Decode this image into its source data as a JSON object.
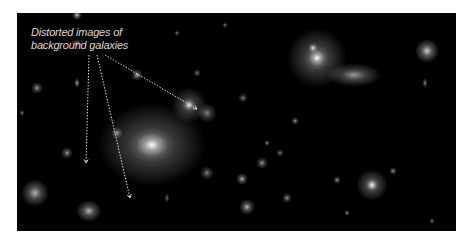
{
  "image": {
    "subject": "galaxy cluster with gravitationally lensed background galaxies",
    "background_color": "#000000",
    "frame": {
      "left": 17,
      "top": 13,
      "width": 439,
      "height": 218
    }
  },
  "annotation": {
    "caption_line1": "Distorted images of",
    "caption_line2": "background galaxies",
    "caption_color": "#d8d8d8",
    "arrow_color": "#dddddd",
    "arrows": [
      {
        "from": [
          72,
          42
        ],
        "to": [
          69,
          150
        ]
      },
      {
        "from": [
          80,
          42
        ],
        "to": [
          113,
          185
        ]
      },
      {
        "from": [
          88,
          42
        ],
        "to": [
          180,
          96
        ]
      }
    ]
  },
  "galaxies": [
    {
      "x": 135,
      "y": 132,
      "r": 42,
      "a": 0.55,
      "ex": 1.3
    },
    {
      "x": 135,
      "y": 132,
      "r": 12,
      "a": 0.95,
      "ex": 1.3
    },
    {
      "x": 300,
      "y": 45,
      "r": 30,
      "a": 0.55,
      "ex": 1
    },
    {
      "x": 300,
      "y": 45,
      "r": 8,
      "a": 1,
      "ex": 1
    },
    {
      "x": 296,
      "y": 35,
      "r": 5,
      "a": 0.9,
      "ex": 1
    },
    {
      "x": 172,
      "y": 92,
      "r": 18,
      "a": 0.5,
      "ex": 1
    },
    {
      "x": 172,
      "y": 92,
      "r": 5,
      "a": 0.9,
      "ex": 1
    },
    {
      "x": 190,
      "y": 100,
      "r": 10,
      "a": 0.5,
      "ex": 1
    },
    {
      "x": 225,
      "y": 166,
      "r": 6,
      "a": 0.7,
      "ex": 1
    },
    {
      "x": 337,
      "y": 62,
      "r": 12,
      "a": 0.6,
      "ex": 2.3
    },
    {
      "x": 410,
      "y": 38,
      "r": 12,
      "a": 0.8,
      "ex": 1
    },
    {
      "x": 355,
      "y": 172,
      "r": 16,
      "a": 0.6,
      "ex": 1
    },
    {
      "x": 355,
      "y": 172,
      "r": 5,
      "a": 1,
      "ex": 1
    },
    {
      "x": 18,
      "y": 180,
      "r": 14,
      "a": 0.7,
      "ex": 1
    },
    {
      "x": 72,
      "y": 198,
      "r": 11,
      "a": 0.7,
      "ex": 1.2
    },
    {
      "x": 230,
      "y": 194,
      "r": 8,
      "a": 0.7,
      "ex": 1
    },
    {
      "x": 245,
      "y": 150,
      "r": 6,
      "a": 0.6,
      "ex": 1
    },
    {
      "x": 60,
      "y": 70,
      "r": 5,
      "a": 0.7,
      "ex": 0.6
    },
    {
      "x": 120,
      "y": 62,
      "r": 6,
      "a": 0.7,
      "ex": 1
    },
    {
      "x": 190,
      "y": 160,
      "r": 7,
      "a": 0.5,
      "ex": 1
    },
    {
      "x": 50,
      "y": 140,
      "r": 6,
      "a": 0.6,
      "ex": 1
    },
    {
      "x": 100,
      "y": 120,
      "r": 6,
      "a": 0.6,
      "ex": 1
    },
    {
      "x": 20,
      "y": 75,
      "r": 6,
      "a": 0.6,
      "ex": 1
    },
    {
      "x": 226,
      "y": 85,
      "r": 5,
      "a": 0.5,
      "ex": 1
    },
    {
      "x": 150,
      "y": 185,
      "r": 5,
      "a": 0.5,
      "ex": 0.5
    },
    {
      "x": 270,
      "y": 185,
      "r": 5,
      "a": 0.6,
      "ex": 1
    },
    {
      "x": 320,
      "y": 167,
      "r": 4,
      "a": 0.6,
      "ex": 1
    },
    {
      "x": 376,
      "y": 158,
      "r": 4,
      "a": 0.6,
      "ex": 1
    },
    {
      "x": 408,
      "y": 70,
      "r": 5,
      "a": 0.6,
      "ex": 0.5
    },
    {
      "x": 278,
      "y": 108,
      "r": 4,
      "a": 0.6,
      "ex": 1
    },
    {
      "x": 263,
      "y": 140,
      "r": 4,
      "a": 0.5,
      "ex": 1
    },
    {
      "x": 60,
      "y": 30,
      "r": 4,
      "a": 0.5,
      "ex": 1.8
    },
    {
      "x": 180,
      "y": 60,
      "r": 4,
      "a": 0.5,
      "ex": 1
    },
    {
      "x": 250,
      "y": 130,
      "r": 3,
      "a": 0.6,
      "ex": 1
    },
    {
      "x": 330,
      "y": 200,
      "r": 3,
      "a": 0.6,
      "ex": 1
    },
    {
      "x": 415,
      "y": 208,
      "r": 3,
      "a": 0.5,
      "ex": 1
    },
    {
      "x": 5,
      "y": 100,
      "r": 3,
      "a": 0.5,
      "ex": 1
    },
    {
      "x": 208,
      "y": 12,
      "r": 3,
      "a": 0.5,
      "ex": 1
    },
    {
      "x": 160,
      "y": 20,
      "r": 3,
      "a": 0.5,
      "ex": 1
    },
    {
      "x": 60,
      "y": 2,
      "r": 5,
      "a": 0.8,
      "ex": 1
    }
  ]
}
